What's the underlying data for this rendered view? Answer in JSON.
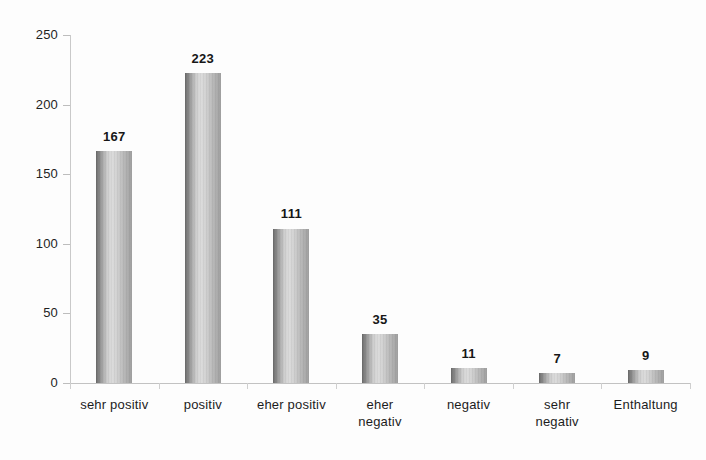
{
  "chart_data": {
    "type": "bar",
    "title": "",
    "subtitle": "",
    "xlabel": "",
    "ylabel": "",
    "categories": [
      "sehr positiv",
      "positiv",
      "eher positiv",
      "eher\nnegativ",
      "negativ",
      "sehr\nnegativ",
      "Enthaltung"
    ],
    "values": [
      167,
      223,
      111,
      35,
      11,
      7,
      9
    ],
    "value_labels": [
      "167",
      "223",
      "111",
      "35",
      "11",
      "7",
      "9"
    ],
    "ylim": [
      0,
      250
    ],
    "yticks": [
      0,
      50,
      100,
      150,
      200,
      250
    ],
    "ytick_labels": [
      "0",
      "50",
      "100",
      "150",
      "200",
      "250"
    ],
    "grid": false,
    "legend": null,
    "legend_position": "none",
    "bar_style": "cylinder",
    "colors": {
      "bar_dark": "#6d6d6d",
      "bar_light": "#dcdcdc",
      "bar_edge": "#9e9e9e",
      "axis_line": "#c2c2c2",
      "tick": "#bdbdbd",
      "text": "#1c1c1c",
      "background": "#fdfdfd"
    }
  }
}
